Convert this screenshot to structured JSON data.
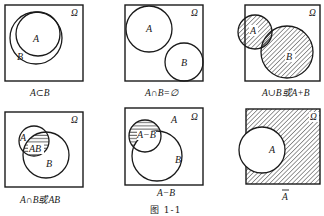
{
  "figure": {
    "caption": "图 1-1",
    "universe_label": "Ω",
    "panels": [
      {
        "id": "subset",
        "set_a_label": "A",
        "set_b_label": "B",
        "caption": "A⊂B",
        "shaded_region": "none"
      },
      {
        "id": "disjoint",
        "set_a_label": "A",
        "set_b_label": "B",
        "caption": "A∩B=∅",
        "shaded_region": "none"
      },
      {
        "id": "union",
        "set_a_label": "A",
        "set_b_label": "B",
        "caption": "A∪B或A+B",
        "shaded_region": "A∪B (diagonal hatch)"
      },
      {
        "id": "intersection",
        "set_a_label": "A",
        "set_b_label": "B",
        "region_label": "AB",
        "caption": "A∩B或AB",
        "shaded_region": "A∩B (horizontal lines)"
      },
      {
        "id": "difference",
        "set_a_label": "A",
        "set_b_label": "B",
        "region_label": "A−B",
        "caption": "A−B",
        "shaded_region": "A−B (horizontal lines)"
      },
      {
        "id": "complement",
        "set_a_label": "A",
        "caption": "A",
        "caption_overline": true,
        "shaded_region": "Ω−A (diagonal hatch)"
      }
    ]
  },
  "colors": {
    "stroke": "#1a1a1a",
    "background": "#ffffff"
  }
}
